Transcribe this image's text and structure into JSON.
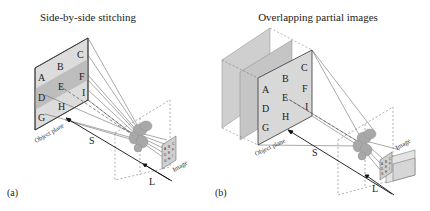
{
  "figure": {
    "panels": [
      {
        "id": "a",
        "panel_label": "(a)",
        "title": "Side-by-side stitching",
        "object_plane_label": "Object plane",
        "image_label": "Image",
        "distance_object_label": "S",
        "distance_image_label": "L",
        "grid_labels": [
          "A",
          "B",
          "C",
          "D",
          "E",
          "F",
          "G",
          "H",
          "I"
        ]
      },
      {
        "id": "b",
        "panel_label": "(b)",
        "title": "Overlapping partial images",
        "object_plane_label": "Object plane",
        "image_label": "Image",
        "distance_object_label": "S",
        "distance_image_label": "L",
        "grid_labels": [
          "A",
          "B",
          "C",
          "D",
          "E",
          "F",
          "G",
          "H",
          "I"
        ]
      }
    ],
    "colors": {
      "plane_fill": "#d9d9d9",
      "band_fill": "#b8b8b8",
      "ghost_fill": "#cfcfcf",
      "line": "#444444",
      "dashed": "#666666",
      "lens_fill": "#a9a9a9",
      "arrow": "#111111"
    }
  }
}
